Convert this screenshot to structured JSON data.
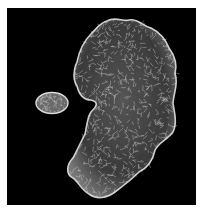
{
  "figure": {
    "background_color": "#000000",
    "mesh_color": "#d8d8d8",
    "objects": [
      {
        "name": "large-protein-surface"
      },
      {
        "name": "small-molecule-surface"
      }
    ]
  }
}
